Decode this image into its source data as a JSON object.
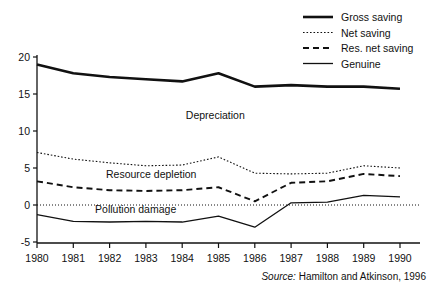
{
  "chart_data": {
    "type": "line",
    "title": "",
    "xlabel": "",
    "ylabel": "",
    "categories": [
      "1980",
      "1981",
      "1982",
      "1983",
      "1984",
      "1985",
      "1986",
      "1987",
      "1988",
      "1989",
      "1990"
    ],
    "x": [
      1980,
      1981,
      1982,
      1983,
      1984,
      1985,
      1986,
      1987,
      1988,
      1989,
      1990
    ],
    "xlim": [
      1980,
      1990
    ],
    "ylim": [
      -5,
      20
    ],
    "yticks": [
      -5,
      0,
      5,
      10,
      15,
      20
    ],
    "grid": false,
    "zero_line": true,
    "legend_position": "top-right",
    "series": [
      {
        "name": "Gross saving",
        "style": "solid-thick",
        "values": [
          19.0,
          17.8,
          17.3,
          17.0,
          16.7,
          17.8,
          16.0,
          16.2,
          16.0,
          16.0,
          15.7
        ]
      },
      {
        "name": "Net saving",
        "style": "dotted",
        "values": [
          7.1,
          6.2,
          5.7,
          5.3,
          5.4,
          6.5,
          4.3,
          4.2,
          4.3,
          5.3,
          5.0
        ]
      },
      {
        "name": "Res. net saving",
        "style": "dashed",
        "values": [
          3.2,
          2.4,
          2.0,
          1.9,
          2.0,
          2.4,
          0.5,
          3.0,
          3.2,
          4.2,
          3.9
        ]
      },
      {
        "name": "Genuine",
        "style": "solid-thin",
        "values": [
          -1.3,
          -2.2,
          -2.3,
          -2.2,
          -2.3,
          -1.5,
          -3.0,
          0.3,
          0.4,
          1.3,
          1.1
        ]
      }
    ],
    "annotations": [
      {
        "text": "Depreciation",
        "x": 1984.1,
        "y": 11.6
      },
      {
        "text": "Resource depletion",
        "x": 1981.9,
        "y": 3.6
      },
      {
        "text": "Pollution damage",
        "x": 1981.6,
        "y": -1.1
      }
    ],
    "source": {
      "prefix": "Source:",
      "text": "Hamilton and Atkinson, 1996"
    }
  }
}
